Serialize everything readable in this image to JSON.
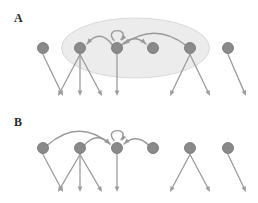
{
  "figure": {
    "width": 258,
    "height": 203,
    "background": "#ffffff",
    "type": "network-diagram"
  },
  "colors": {
    "node_fill": "#8a8a8a",
    "node_stroke": "#6f6f6f",
    "edge": "#9c9c9c",
    "arc": "#9a9a9a",
    "ellipse_fill": "#ececec",
    "ellipse_stroke": "#d9d9d9",
    "label_text": "#2b2b2b"
  },
  "panels": [
    {
      "id": "A",
      "label": "A",
      "label_x": 14,
      "label_y": 12,
      "node_y": 48,
      "leaf_y": 96,
      "has_group_ellipse": true,
      "group_ellipse": {
        "cx": 135.5,
        "cy": 48,
        "rx": 74,
        "ry": 30,
        "fill": "#ececec",
        "stroke": "#d9d9d9"
      },
      "nodes": [
        {
          "id": "a1",
          "x": 43,
          "r": 5.5,
          "leaves": 1
        },
        {
          "id": "a2",
          "x": 80,
          "r": 5.5,
          "leaves": 3
        },
        {
          "id": "a3",
          "x": 117,
          "r": 5.5,
          "leaves": 1
        },
        {
          "id": "a4",
          "x": 153,
          "r": 5.5,
          "leaves": 0
        },
        {
          "id": "a5",
          "x": 190,
          "r": 5.5,
          "leaves": 2
        },
        {
          "id": "a6",
          "x": 228,
          "r": 5.5,
          "leaves": 1
        }
      ],
      "arcs": [
        {
          "from": "a3",
          "to": "a2",
          "height": 16,
          "direction": "left"
        },
        {
          "from": "a3",
          "to": "a4",
          "height": 11,
          "direction": "right"
        },
        {
          "from": "a5",
          "to": "a3",
          "height": 22,
          "direction": "left"
        }
      ],
      "self_loops": [
        {
          "node": "a3",
          "radius": 9
        }
      ]
    },
    {
      "id": "B",
      "label": "B",
      "label_x": 14,
      "label_y": 116,
      "node_y": 148,
      "leaf_y": 192,
      "has_group_ellipse": false,
      "nodes": [
        {
          "id": "b1",
          "x": 43,
          "r": 5.5,
          "leaves": 1
        },
        {
          "id": "b2",
          "x": 80,
          "r": 5.5,
          "leaves": 3
        },
        {
          "id": "b3",
          "x": 117,
          "r": 5.5,
          "leaves": 1
        },
        {
          "id": "b4",
          "x": 153,
          "r": 5.5,
          "leaves": 0
        },
        {
          "id": "b5",
          "x": 190,
          "r": 5.5,
          "leaves": 2
        },
        {
          "id": "b6",
          "x": 228,
          "r": 5.5,
          "leaves": 1
        }
      ],
      "arcs": [
        {
          "from": "b1",
          "to": "b3",
          "height": 26,
          "direction": "right"
        },
        {
          "from": "b2",
          "to": "b3",
          "height": 13,
          "direction": "right"
        },
        {
          "from": "b4",
          "to": "b3",
          "height": 11,
          "direction": "left"
        }
      ],
      "self_loops": [
        {
          "node": "b3",
          "radius": 9
        }
      ]
    }
  ],
  "leaf_layouts": {
    "1_left": [
      -22
    ],
    "1_down": [
      0
    ],
    "1_right": [
      22
    ],
    "2": [
      -20,
      20
    ],
    "3": [
      -22,
      0,
      22
    ]
  }
}
